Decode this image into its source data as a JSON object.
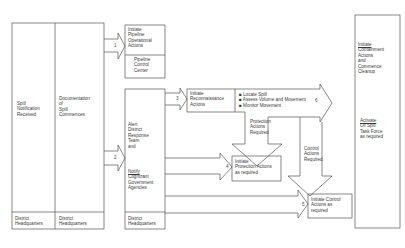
{
  "diagram": {
    "type": "flowchart",
    "columns": [
      {
        "id": "spill-notification",
        "label": "Spill Notification Received",
        "lines": [
          "Spill",
          "Notification",
          "Received"
        ],
        "footer": [
          "District",
          "Headquarters"
        ]
      },
      {
        "id": "documentation",
        "label": "Documentation of Spill Commences",
        "lines": [
          "Documentation",
          "of",
          "Spill",
          "Commences"
        ],
        "footer": [
          "District",
          "Headquarters"
        ]
      },
      {
        "id": "alert",
        "lines_top": [
          "Alert",
          "District",
          "Response",
          "Team",
          "and"
        ],
        "lines_bottom": [
          "Notify",
          "Cognizant",
          "Government",
          "Agencies"
        ],
        "footer": [
          "District",
          "Headquarters"
        ]
      },
      {
        "id": "containment",
        "lines_top": [
          "Initiate",
          "Containment",
          "Actions",
          "and",
          "Commence",
          "Cleanup"
        ],
        "lines_bottom": [
          "Activate",
          "Oil Spill",
          "Task Force",
          "as required"
        ]
      }
    ],
    "boxes": {
      "pipeline": {
        "lines": [
          "Initiate",
          "Pipeline",
          "Operational",
          "Actions"
        ],
        "sub": [
          "Pipeline",
          "Control",
          "Center"
        ]
      },
      "reconnaissance": {
        "lines": [
          "Initiate",
          "Reconnaissance",
          "Actions"
        ]
      },
      "protection": {
        "lines": [
          "Initiate",
          "Protection Actions",
          "as required"
        ]
      },
      "control": {
        "lines": [
          "Initiate Control",
          "Actions as",
          "required"
        ]
      }
    },
    "bullets": [
      "Locate Spill",
      "Assess Volume and Movement",
      "Monitor Movement"
    ],
    "labels": {
      "protection_required": [
        "Protection",
        "Actions",
        "Required"
      ],
      "control_required": [
        "Control",
        "Actions",
        "Required"
      ]
    },
    "arrows": [
      {
        "number": "1",
        "from": "documentation",
        "to": "pipeline"
      },
      {
        "number": "2",
        "from": "documentation",
        "to": "alert"
      },
      {
        "number": "3",
        "from": "alert",
        "to": "reconnaissance"
      },
      {
        "number": "4",
        "from": "alert",
        "to": "protection"
      },
      {
        "number": "5",
        "from": "alert",
        "to": "control"
      },
      {
        "number": "6",
        "from": "reconnaissance",
        "to": "containment"
      }
    ]
  }
}
